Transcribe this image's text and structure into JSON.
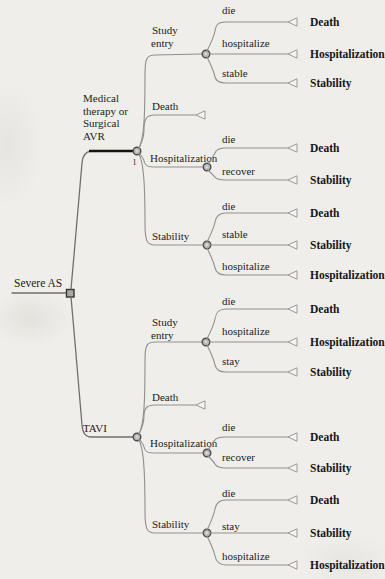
{
  "figure_type": "decision-tree",
  "colors": {
    "ink": "#1c1c1c",
    "line_gray": "#8f8f8f",
    "thick_line": "#141414"
  },
  "root": {
    "label": "Severe AS"
  },
  "arms": [
    {
      "label_lines": [
        "Medical",
        "therapy or",
        "Surgical",
        "AVR"
      ],
      "node_number": "1",
      "children": [
        {
          "label_lines": [
            "Study",
            "entry"
          ],
          "branches": [
            {
              "label": "die",
              "outcome": "Death"
            },
            {
              "label": "hospitalize",
              "outcome": "Hospitalization"
            },
            {
              "label": "stable",
              "outcome": "Stability"
            }
          ]
        },
        {
          "label": "Death",
          "terminal": true
        },
        {
          "label": "Hospitalization",
          "branches": [
            {
              "label": "die",
              "outcome": "Death"
            },
            {
              "label": "recover",
              "outcome": "Stability"
            }
          ]
        },
        {
          "label": "Stability",
          "branches": [
            {
              "label": "die",
              "outcome": "Death"
            },
            {
              "label": "stable",
              "outcome": "Stability"
            },
            {
              "label": "hospitalize",
              "outcome": "Hospitalization"
            }
          ]
        }
      ]
    },
    {
      "label": "TAVI",
      "children": [
        {
          "label_lines": [
            "Study",
            "entry"
          ],
          "branches": [
            {
              "label": "die",
              "outcome": "Death"
            },
            {
              "label": "hospitalize",
              "outcome": "Hospitalization"
            },
            {
              "label": "stay",
              "outcome": "Stability"
            }
          ]
        },
        {
          "label": "Death",
          "terminal": true
        },
        {
          "label": "Hospitalization",
          "branches": [
            {
              "label": "die",
              "outcome": "Death"
            },
            {
              "label": "recover",
              "outcome": "Stability"
            }
          ]
        },
        {
          "label": "Stability",
          "branches": [
            {
              "label": "die",
              "outcome": "Death"
            },
            {
              "label": "stay",
              "outcome": "Stability"
            },
            {
              "label": "hospitalize",
              "outcome": "Hospitalization"
            }
          ]
        }
      ]
    }
  ]
}
